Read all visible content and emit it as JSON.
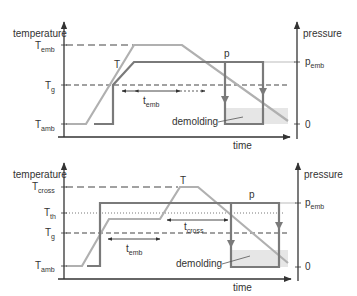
{
  "colors": {
    "axis": "#333333",
    "temperature_curve": "#b0b0b0",
    "pressure_curve": "#7a7a7a",
    "guide_dash": "#444444",
    "demolding_fill": "#e6e6e6",
    "text": "#333333"
  },
  "charts": [
    {
      "id": "embossing",
      "left_axis_label": "temperature",
      "right_axis_label": "pressure",
      "x_axis_label": "time",
      "temperature_ticks": [
        {
          "main": "T",
          "sub": "emb"
        },
        {
          "main": "T",
          "sub": "g"
        },
        {
          "main": "T",
          "sub": "amb"
        }
      ],
      "pressure_ticks": [
        {
          "main": "p",
          "sub": "emb"
        },
        {
          "main": "0",
          "sub": ""
        }
      ],
      "curve_labels": {
        "temperature": "T",
        "pressure": "p"
      },
      "interval": {
        "main": "t",
        "sub": "emb"
      },
      "region_label": "demolding"
    },
    {
      "id": "crosslinking",
      "left_axis_label": "temperature",
      "right_axis_label": "pressure",
      "x_axis_label": "time",
      "temperature_ticks": [
        {
          "main": "T",
          "sub": "cross"
        },
        {
          "main": "T",
          "sub": "th"
        },
        {
          "main": "T",
          "sub": "g"
        },
        {
          "main": "T",
          "sub": "amb"
        }
      ],
      "pressure_ticks": [
        {
          "main": "p",
          "sub": "emb"
        },
        {
          "main": "0",
          "sub": ""
        }
      ],
      "curve_labels": {
        "temperature": "T",
        "pressure": "p"
      },
      "intervals": [
        {
          "main": "t",
          "sub": "emb"
        },
        {
          "main": "t",
          "sub": "cross"
        }
      ],
      "region_label": "demolding"
    }
  ]
}
